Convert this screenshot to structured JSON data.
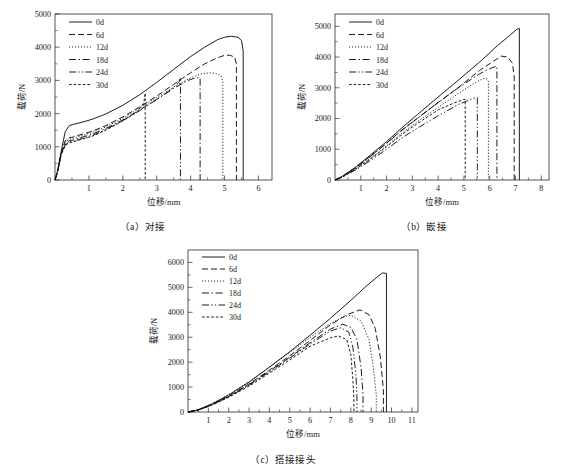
{
  "figure": {
    "panels": [
      "a",
      "b",
      "c"
    ]
  },
  "captions": {
    "a": "（a）对接",
    "b": "（b）嵌接",
    "c": "（c）搭接接头"
  },
  "axis_titles": {
    "x": "位移/mm",
    "y": "载荷/N"
  },
  "legend": {
    "entries": [
      {
        "label": "0d",
        "style": "solid"
      },
      {
        "label": "6d",
        "style": "dashed"
      },
      {
        "label": "12d",
        "style": "dotted"
      },
      {
        "label": "18d",
        "style": "dashdot"
      },
      {
        "label": "24d",
        "style": "dashdotdot"
      },
      {
        "label": "30d",
        "style": "finedash"
      }
    ]
  },
  "chart_data": [
    {
      "type": "line",
      "panel": "a",
      "title": "（a）对接",
      "xlabel": "位移/mm",
      "ylabel": "载荷/N",
      "xlim": [
        0,
        6.4
      ],
      "ylim": [
        0,
        5000
      ],
      "xticks": [
        1,
        2,
        3,
        4,
        5,
        6
      ],
      "yticks": [
        0,
        1000,
        2000,
        3000,
        4000,
        5000
      ],
      "grid": false,
      "legend_position": "top-left",
      "series": [
        {
          "name": "0d",
          "style": "solid",
          "peak_load": 4330,
          "peak_displacement": 5.2,
          "failure_displacement": 5.55,
          "x": [
            0,
            0.08,
            0.18,
            0.3,
            0.42,
            0.55,
            0.8,
            1.1,
            1.5,
            2.0,
            2.5,
            3.0,
            3.5,
            4.0,
            4.4,
            4.8,
            5.0,
            5.2,
            5.4,
            5.5,
            5.55,
            5.55
          ],
          "y": [
            0,
            300,
            850,
            1450,
            1640,
            1680,
            1740,
            1830,
            1990,
            2250,
            2570,
            2940,
            3330,
            3720,
            3990,
            4230,
            4300,
            4330,
            4300,
            4200,
            3900,
            0
          ]
        },
        {
          "name": "6d",
          "style": "dashed",
          "peak_load": 3760,
          "peak_displacement": 5.0,
          "failure_displacement": 5.35,
          "x": [
            0,
            0.08,
            0.18,
            0.3,
            0.42,
            0.55,
            0.8,
            1.1,
            1.5,
            2.0,
            2.5,
            3.0,
            3.5,
            4.0,
            4.4,
            4.7,
            4.95,
            5.15,
            5.3,
            5.35,
            5.35
          ],
          "y": [
            0,
            280,
            800,
            1180,
            1270,
            1300,
            1380,
            1470,
            1640,
            1900,
            2200,
            2530,
            2880,
            3230,
            3490,
            3640,
            3740,
            3760,
            3700,
            3500,
            0
          ]
        },
        {
          "name": "12d",
          "style": "dotted",
          "peak_load": 3230,
          "peak_displacement": 4.62,
          "failure_displacement": 4.95,
          "x": [
            0,
            0.08,
            0.18,
            0.3,
            0.42,
            0.55,
            0.8,
            1.1,
            1.5,
            2.0,
            2.5,
            3.0,
            3.5,
            4.0,
            4.3,
            4.55,
            4.75,
            4.9,
            4.95,
            4.95
          ],
          "y": [
            0,
            280,
            790,
            1150,
            1230,
            1260,
            1340,
            1430,
            1600,
            1860,
            2160,
            2480,
            2800,
            3080,
            3190,
            3230,
            3210,
            3130,
            2950,
            0
          ]
        },
        {
          "name": "18d",
          "style": "dashdot",
          "peak_load": 3080,
          "peak_displacement": 4.15,
          "failure_displacement": 4.28,
          "x": [
            0,
            0.08,
            0.18,
            0.3,
            0.42,
            0.55,
            0.8,
            1.1,
            1.5,
            2.0,
            2.5,
            3.0,
            3.5,
            3.9,
            4.15,
            4.28,
            4.28
          ],
          "y": [
            0,
            270,
            770,
            1100,
            1180,
            1210,
            1290,
            1380,
            1550,
            1810,
            2110,
            2430,
            2760,
            2990,
            3080,
            3080,
            0
          ]
        },
        {
          "name": "24d",
          "style": "dashdotdot",
          "peak_load": 3080,
          "peak_displacement": 3.65,
          "failure_displacement": 3.7,
          "x": [
            0,
            0.08,
            0.18,
            0.3,
            0.42,
            0.55,
            0.8,
            1.1,
            1.5,
            2.0,
            2.5,
            3.0,
            3.4,
            3.65,
            3.7,
            3.7
          ],
          "y": [
            0,
            265,
            760,
            1060,
            1140,
            1170,
            1250,
            1340,
            1520,
            1790,
            2090,
            2420,
            2700,
            2940,
            3080,
            0
          ]
        },
        {
          "name": "30d",
          "style": "finedash",
          "peak_load": 2620,
          "peak_displacement": 2.62,
          "failure_displacement": 2.66,
          "x": [
            0,
            0.08,
            0.18,
            0.3,
            0.42,
            0.55,
            0.8,
            1.1,
            1.5,
            2.0,
            2.4,
            2.62,
            2.66,
            2.66
          ],
          "y": [
            0,
            260,
            750,
            1040,
            1120,
            1150,
            1230,
            1320,
            1500,
            1780,
            2030,
            2320,
            2620,
            0
          ]
        }
      ]
    },
    {
      "type": "line",
      "panel": "b",
      "title": "（b）嵌接",
      "xlabel": "位移/mm",
      "ylabel": "载荷/N",
      "xlim": [
        0,
        8.3
      ],
      "ylim": [
        0,
        5400
      ],
      "xticks": [
        1,
        2,
        3,
        4,
        5,
        6,
        7,
        8
      ],
      "yticks": [
        0,
        1000,
        2000,
        3000,
        4000,
        5000
      ],
      "grid": false,
      "legend_position": "top-left",
      "series": [
        {
          "name": "0d",
          "style": "solid",
          "peak_load": 4930,
          "peak_displacement": 7.05,
          "failure_displacement": 7.15,
          "x": [
            0,
            0.3,
            0.8,
            1.4,
            2.0,
            2.6,
            3.2,
            4.0,
            4.8,
            5.6,
            6.3,
            6.8,
            7.05,
            7.15,
            7.15
          ],
          "y": [
            0,
            130,
            420,
            830,
            1250,
            1700,
            2130,
            2700,
            3260,
            3830,
            4370,
            4720,
            4900,
            4930,
            0
          ]
        },
        {
          "name": "6d",
          "style": "dashed",
          "peak_load": 4030,
          "peak_displacement": 6.45,
          "failure_displacement": 6.95,
          "x": [
            0,
            0.3,
            0.8,
            1.4,
            2.0,
            2.6,
            3.2,
            4.0,
            4.8,
            5.6,
            6.1,
            6.45,
            6.7,
            6.88,
            6.95,
            6.95
          ],
          "y": [
            0,
            120,
            400,
            790,
            1200,
            1630,
            2010,
            2520,
            3020,
            3560,
            3840,
            4030,
            4000,
            3800,
            3350,
            0
          ]
        },
        {
          "name": "12d",
          "style": "dotted",
          "peak_load": 3300,
          "peak_displacement": 5.75,
          "failure_displacement": 5.95,
          "x": [
            0,
            0.3,
            0.8,
            1.4,
            2.0,
            2.6,
            3.2,
            4.0,
            4.8,
            5.4,
            5.75,
            5.9,
            5.95,
            5.95
          ],
          "y": [
            0,
            110,
            360,
            720,
            1110,
            1530,
            1900,
            2360,
            2820,
            3150,
            3300,
            3290,
            3200,
            0
          ]
        },
        {
          "name": "18d",
          "style": "dashdot",
          "peak_load": 3700,
          "peak_displacement": 6.25,
          "failure_displacement": 6.28,
          "x": [
            0,
            0.3,
            0.8,
            1.4,
            2.0,
            2.6,
            3.2,
            4.0,
            4.8,
            5.6,
            6.0,
            6.25,
            6.28,
            6.28
          ],
          "y": [
            0,
            115,
            390,
            780,
            1190,
            1620,
            2010,
            2520,
            3010,
            3450,
            3620,
            3700,
            3700,
            0
          ]
        },
        {
          "name": "24d",
          "style": "dashdotdot",
          "peak_load": 2680,
          "peak_displacement": 5.45,
          "failure_displacement": 5.52,
          "x": [
            0,
            0.3,
            0.8,
            1.4,
            2.0,
            2.6,
            3.2,
            4.0,
            4.8,
            5.2,
            5.45,
            5.52,
            5.52
          ],
          "y": [
            0,
            100,
            330,
            650,
            1000,
            1370,
            1690,
            2090,
            2460,
            2600,
            2680,
            2680,
            0
          ]
        },
        {
          "name": "30d",
          "style": "finedash",
          "peak_load": 2620,
          "peak_displacement": 5.0,
          "failure_displacement": 5.05,
          "x": [
            0,
            0.3,
            0.8,
            1.4,
            2.0,
            2.6,
            3.2,
            4.0,
            4.6,
            5.0,
            5.05,
            5.05
          ],
          "y": [
            0,
            105,
            350,
            700,
            1080,
            1480,
            1840,
            2280,
            2500,
            2620,
            2620,
            0
          ]
        }
      ]
    },
    {
      "type": "line",
      "panel": "c",
      "title": "（c）搭接接头",
      "xlabel": "位移/mm",
      "ylabel": "载荷/N",
      "xlim": [
        0,
        11.3
      ],
      "ylim": [
        0,
        6500
      ],
      "xticks": [
        1,
        2,
        3,
        4,
        5,
        6,
        7,
        8,
        9,
        10,
        11
      ],
      "yticks": [
        0,
        1000,
        2000,
        3000,
        4000,
        5000,
        6000
      ],
      "grid": false,
      "legend_position": "top-left",
      "series": [
        {
          "name": "0d",
          "style": "solid",
          "peak_load": 5580,
          "peak_displacement": 9.55,
          "failure_displacement": 9.75,
          "x": [
            0,
            0.5,
            1.2,
            2.0,
            3.0,
            4.0,
            5.0,
            6.0,
            7.0,
            8.0,
            8.8,
            9.3,
            9.55,
            9.75,
            9.75
          ],
          "y": [
            0,
            90,
            330,
            680,
            1200,
            1800,
            2420,
            3080,
            3760,
            4480,
            5080,
            5420,
            5580,
            5560,
            0
          ]
        },
        {
          "name": "6d",
          "style": "dashed",
          "peak_load": 4100,
          "peak_displacement": 8.45,
          "failure_displacement": 9.6,
          "x": [
            0,
            0.5,
            1.2,
            2.0,
            3.0,
            4.0,
            5.0,
            6.0,
            7.0,
            7.8,
            8.45,
            8.9,
            9.2,
            9.45,
            9.6,
            9.6
          ],
          "y": [
            0,
            85,
            310,
            640,
            1130,
            1680,
            2260,
            2870,
            3500,
            3900,
            4100,
            3900,
            3350,
            2200,
            900,
            0
          ]
        },
        {
          "name": "12d",
          "style": "dotted",
          "peak_load": 3880,
          "peak_displacement": 8.0,
          "failure_displacement": 9.25,
          "x": [
            0,
            0.5,
            1.2,
            2.0,
            3.0,
            4.0,
            5.0,
            6.0,
            7.0,
            7.6,
            8.0,
            8.5,
            8.9,
            9.1,
            9.25,
            9.25
          ],
          "y": [
            0,
            95,
            340,
            700,
            1220,
            1800,
            2390,
            2990,
            3550,
            3800,
            3880,
            3650,
            2900,
            1800,
            700,
            0
          ]
        },
        {
          "name": "18d",
          "style": "dashdot",
          "peak_load": 3520,
          "peak_displacement": 7.6,
          "failure_displacement": 8.6,
          "x": [
            0,
            0.5,
            1.2,
            2.0,
            3.0,
            4.0,
            5.0,
            6.0,
            7.0,
            7.6,
            8.0,
            8.3,
            8.5,
            8.6,
            8.6
          ],
          "y": [
            0,
            80,
            300,
            620,
            1100,
            1640,
            2200,
            2780,
            3330,
            3520,
            3400,
            2900,
            1800,
            700,
            0
          ]
        },
        {
          "name": "24d",
          "style": "dashdotdot",
          "peak_load": 3380,
          "peak_displacement": 7.5,
          "failure_displacement": 8.3,
          "x": [
            0,
            0.5,
            1.2,
            2.0,
            3.0,
            4.0,
            5.0,
            6.0,
            7.0,
            7.5,
            7.9,
            8.1,
            8.25,
            8.3,
            8.3
          ],
          "y": [
            0,
            78,
            295,
            610,
            1080,
            1610,
            2160,
            2730,
            3250,
            3380,
            3200,
            2600,
            1500,
            600,
            0
          ]
        },
        {
          "name": "30d",
          "style": "finedash",
          "peak_load": 3050,
          "peak_displacement": 7.4,
          "failure_displacement": 8.15,
          "x": [
            0,
            0.5,
            1.2,
            2.0,
            3.0,
            4.0,
            5.0,
            6.0,
            7.0,
            7.4,
            7.8,
            8.0,
            8.1,
            8.15,
            8.15
          ],
          "y": [
            0,
            75,
            285,
            590,
            1040,
            1560,
            2090,
            2640,
            2980,
            3050,
            2900,
            2300,
            1300,
            500,
            0
          ]
        }
      ]
    }
  ]
}
